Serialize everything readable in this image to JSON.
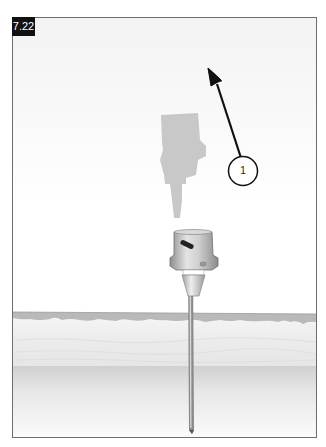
{
  "figure": {
    "label": "7.22",
    "label_bg": "#111111",
    "label_fg": "#ffffff"
  },
  "callout": {
    "number": "1",
    "arrow_direction": "up-left",
    "meaning": "withdraw-hub-upward"
  },
  "illustration": {
    "subject": "needle-inserted-through-skin",
    "elements": [
      "ghost-syringe-hub",
      "needle-hub",
      "needle-shaft",
      "epidermis-layer",
      "dermis-layer",
      "subcutaneous-layer"
    ],
    "colors": {
      "frame_border": "#6e6e6e",
      "epidermis": "#b9b9b9",
      "dermis": "#ececec",
      "subcutaneous": "#d8d8d8",
      "ghost_hub": "#c8c8c8",
      "hub_metal": "#a9a9a9",
      "needle": "#7a7a7a",
      "arrow": "#111111"
    }
  }
}
